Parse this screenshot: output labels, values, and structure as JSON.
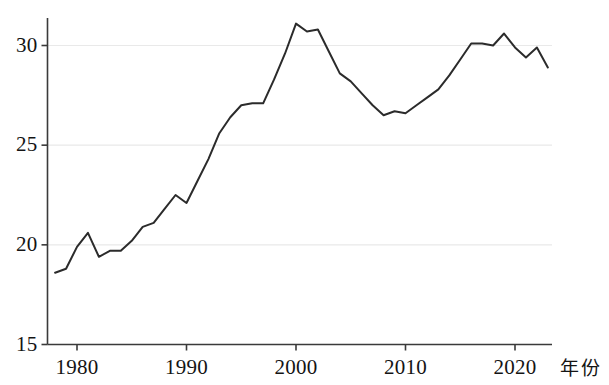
{
  "chart_data": {
    "type": "line",
    "title": "",
    "subtitle": "",
    "xlabel": "年份",
    "ylabel": "",
    "xlim": [
      1977.3,
      2023.4
    ],
    "ylim": [
      14.2,
      31.9
    ],
    "grid": true,
    "grid_axis": "y",
    "legend": false,
    "legend_position": "none",
    "x_ticks": [
      1980,
      1990,
      2000,
      2010,
      2020
    ],
    "x_tick_labels": [
      "1980",
      "1990",
      "2000",
      "2010",
      "2020"
    ],
    "y_ticks": [
      15,
      20,
      25,
      30
    ],
    "y_tick_labels": [
      "15",
      "20",
      "25",
      "30"
    ],
    "line_color": "#2b2b2b",
    "line_width": 2.0,
    "series": [
      {
        "name": "series-1",
        "x": [
          1978,
          1979,
          1980,
          1981,
          1982,
          1983,
          1984,
          1985,
          1986,
          1987,
          1988,
          1989,
          1990,
          1991,
          1992,
          1993,
          1994,
          1995,
          1996,
          1997,
          1998,
          1999,
          2000,
          2001,
          2002,
          2003,
          2004,
          2005,
          2006,
          2007,
          2008,
          2009,
          2010,
          2011,
          2012,
          2013,
          2014,
          2015,
          2016,
          2017,
          2018,
          2019,
          2020,
          2021,
          2022,
          2023
        ],
        "values": [
          18.6,
          18.8,
          19.9,
          20.6,
          19.4,
          19.7,
          19.7,
          20.2,
          20.9,
          21.1,
          21.8,
          22.5,
          22.1,
          23.2,
          24.3,
          25.6,
          26.4,
          27.0,
          27.1,
          27.1,
          28.3,
          29.6,
          31.1,
          30.7,
          30.8,
          29.7,
          28.6,
          28.2,
          27.6,
          27.0,
          26.5,
          26.7,
          26.6,
          27.0,
          27.4,
          27.8,
          28.5,
          29.3,
          30.1,
          30.1,
          30.0,
          30.6,
          29.9,
          29.4,
          29.9,
          28.9
        ]
      }
    ]
  },
  "axes": {
    "x_title": "年份"
  }
}
